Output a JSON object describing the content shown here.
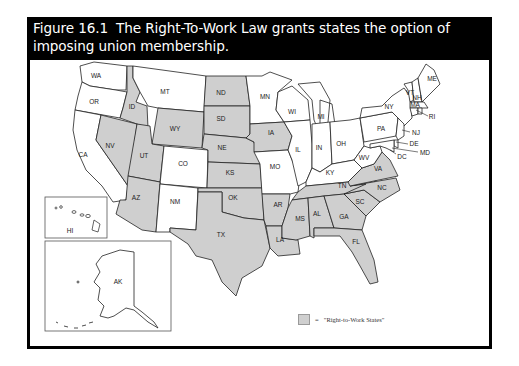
{
  "figure": {
    "number": "Figure 16.1",
    "title": "The Right-To-Work Law grants states the option of imposing union membership.",
    "title_line1": "The Right-To-Work Law grants states the option of",
    "title_line2": "imposing union membership."
  },
  "legend": {
    "symbol": "=",
    "label": "\"Right-to-Work States\"",
    "swatch_color": "#cfcfcf"
  },
  "colors": {
    "right_to_work": "#cfcfcf",
    "other": "#ffffff",
    "header_bg": "#000000",
    "header_text": "#ffffff"
  },
  "states": {
    "right_to_work": [
      "ID",
      "NV",
      "UT",
      "WY",
      "AZ",
      "ND",
      "SD",
      "NE",
      "KS",
      "OK",
      "TX",
      "IA",
      "AR",
      "LA",
      "MS",
      "AL",
      "TN",
      "GA",
      "FL",
      "SC",
      "NC",
      "VA"
    ],
    "non_right_to_work": [
      "WA",
      "OR",
      "CA",
      "MT",
      "CO",
      "NM",
      "MN",
      "WI",
      "MI",
      "IL",
      "IN",
      "OH",
      "KY",
      "MO",
      "WV",
      "PA",
      "NY",
      "ME",
      "VT",
      "NH",
      "MA",
      "RI",
      "CT",
      "NJ",
      "DE",
      "MD",
      "DC",
      "AK",
      "HI"
    ]
  },
  "labels": {
    "WA": "WA",
    "OR": "OR",
    "CA": "CA",
    "ID": "ID",
    "NV": "NV",
    "MT": "MT",
    "WY": "WY",
    "UT": "UT",
    "CO": "CO",
    "AZ": "AZ",
    "NM": "NM",
    "ND": "ND",
    "SD": "SD",
    "NE": "NE",
    "KS": "KS",
    "OK": "OK",
    "TX": "TX",
    "MN": "MN",
    "IA": "IA",
    "MO": "MO",
    "AR": "AR",
    "LA": "LA",
    "WI": "WI",
    "IL": "IL",
    "MI": "MI",
    "IN": "IN",
    "OH": "OH",
    "KY": "KY",
    "TN": "TN",
    "MS": "MS",
    "AL": "AL",
    "GA": "GA",
    "FL": "FL",
    "SC": "SC",
    "NC": "NC",
    "VA": "VA",
    "WV": "WV",
    "PA": "PA",
    "NY": "NY",
    "VT": "VT",
    "NH": "NH",
    "ME": "ME",
    "MA": "MA",
    "RI": "RI",
    "NJ": "NJ",
    "DE": "DE",
    "MD": "MD",
    "DC": "DC",
    "AK": "AK",
    "HI": "HI"
  }
}
